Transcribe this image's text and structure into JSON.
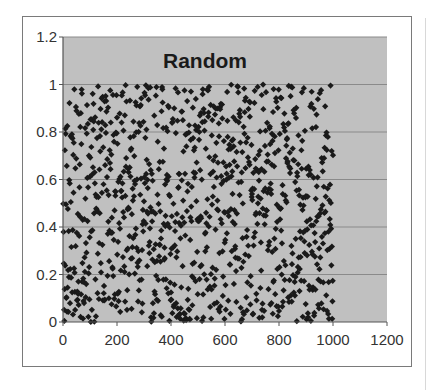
{
  "chart_data": {
    "type": "scatter",
    "title": "Random",
    "xlabel": "",
    "ylabel": "",
    "xlim": [
      0,
      1200
    ],
    "ylim": [
      0,
      1.2
    ],
    "x_ticks": [
      0,
      200,
      400,
      600,
      800,
      1000,
      1200
    ],
    "x_tick_labels": [
      "0",
      "200",
      "400",
      "600",
      "800",
      "1000",
      "1200"
    ],
    "y_ticks": [
      0,
      0.2,
      0.4,
      0.6,
      0.8,
      1,
      1.2
    ],
    "y_tick_labels": [
      "0",
      "0.2",
      "0.4",
      "0.6",
      "0.8",
      "1",
      "1.2"
    ],
    "grid": {
      "horizontal": true,
      "vertical": false
    },
    "legend": "none",
    "marker": "diamond",
    "colors": {
      "plot_area": "#c0c0c0",
      "marker": "#1a1a1a",
      "gridline": "#8a8a8a",
      "axis": "#555555",
      "frame": "#7a7a7a"
    },
    "series": [
      {
        "name": "Random",
        "description": "1000 points, x = index 1..1000, y uniformly random in [0, 1)",
        "n_points": 1000,
        "x_range": [
          1,
          1000
        ],
        "y_range": [
          0,
          1
        ],
        "seed": 20240517
      }
    ]
  }
}
